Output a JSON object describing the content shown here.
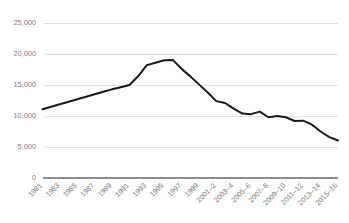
{
  "chart_data": {
    "type": "line",
    "title": "",
    "subtitle": "",
    "xlabel": "",
    "ylabel": "",
    "ylim": [
      0,
      25000
    ],
    "ytick_labels": [
      "0",
      "5,000",
      "10,000",
      "15,000",
      "20,000",
      "25,000"
    ],
    "ytick_values": [
      0,
      5000,
      10000,
      15000,
      20000,
      25000
    ],
    "grid": true,
    "legend": false,
    "legend_position": "none",
    "categories": [
      "1981",
      "1982",
      "1983",
      "1984",
      "1985",
      "1986",
      "1987",
      "1988",
      "1989",
      "1990",
      "1991",
      "1992",
      "1993",
      "1994",
      "1995",
      "1996",
      "1997",
      "1998",
      "1999",
      "2000-1",
      "2001-2",
      "2002-3",
      "2003-4",
      "2004-5",
      "2005-6",
      "2006-7",
      "2007-8",
      "2008-9",
      "2009-10",
      "2010-11",
      "2011-12",
      "2012-13",
      "2013-14",
      "2014-15",
      "2015-16"
    ],
    "xtick_labels": [
      "1981",
      "1983",
      "1985",
      "1987",
      "1989",
      "1991",
      "1993",
      "1995",
      "1997",
      "1999",
      "2001–2",
      "2003–4",
      "2005–6",
      "2007–8",
      "2009–10",
      "2011–12",
      "2013–14",
      "2015–16"
    ],
    "values": [
      11100,
      11500,
      11900,
      12300,
      12700,
      13100,
      13500,
      13900,
      14300,
      14650,
      15000,
      16400,
      18200,
      18600,
      19000,
      19050,
      17600,
      16400,
      15100,
      13800,
      12400,
      12100,
      11200,
      10400,
      10300,
      10700,
      9800,
      10000,
      9800,
      9200,
      9250,
      8600,
      7500,
      6600,
      6050
    ],
    "series_name": "Value",
    "line_color": "#1a1a1a",
    "grid_color": "#d9d9d9",
    "axis_color": "#8c8c8c",
    "label_color": "#7a7a7a"
  }
}
